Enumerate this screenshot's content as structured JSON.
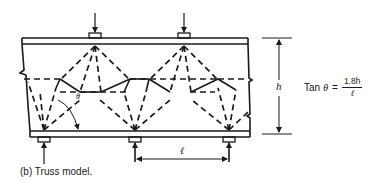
{
  "figure": {
    "caption": "(b)  Truss model.",
    "labels": {
      "height": "h",
      "span": "ℓ",
      "angle": "θ"
    },
    "formula": {
      "lhs_word": "Tan",
      "lhs_symbol": "θ",
      "equals": "=",
      "numerator": "1.8h",
      "denominator": "ℓ"
    },
    "loads": {
      "top_point_loads": 2,
      "bottom_reactions": 3
    },
    "colors": {
      "ink": "#1a1a1a",
      "background": "#ffffff"
    }
  }
}
